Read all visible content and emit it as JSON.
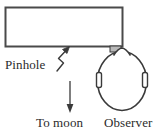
{
  "figure": {
    "name": "pinhole-camera-moon-observation-diagram",
    "width": 158,
    "height": 136,
    "background_color": "#ffffff",
    "stroke_color": "#3a3a3a",
    "text_color": "#2b2b2b"
  },
  "labels": {
    "pinhole": "Pinhole",
    "to_moon": "To moon",
    "observer": "Observer"
  },
  "shapes": {
    "box": {
      "name": "pinhole-camera-box",
      "x": 5,
      "y": 7,
      "width": 118,
      "height": 40,
      "fill": "#ffffff",
      "stroke": "#4a4a4a"
    },
    "pinhole_tab": {
      "name": "pinhole-aperture-tab",
      "x": 110,
      "y": 46,
      "width": 11,
      "height": 6,
      "fill": "#b8b8b8",
      "stroke": "#3a3a3a"
    },
    "head": {
      "name": "observer-head-oval",
      "cx": 122,
      "cy": 81,
      "rx": 25,
      "ry": 30,
      "fill": "#ffffff",
      "stroke": "#3a3a3a"
    },
    "nose": {
      "name": "observer-nose",
      "points": "114,54 122,48 130,54"
    },
    "ear_left": {
      "name": "observer-left-ear",
      "x": 96,
      "y": 73,
      "width": 5,
      "height": 15
    },
    "ear_right": {
      "name": "observer-right-ear",
      "x": 143,
      "y": 73,
      "width": 5,
      "height": 15
    },
    "pinhole_leader": {
      "name": "pinhole-zigzag-leader-arrow",
      "path": "M 57,70 L 63,62 L 58,58 L 66,50",
      "arrow_tip": "69,47"
    },
    "moon_arrow": {
      "name": "to-moon-direction-arrow",
      "x": 70,
      "y_start": 81,
      "y_end": 112
    }
  }
}
